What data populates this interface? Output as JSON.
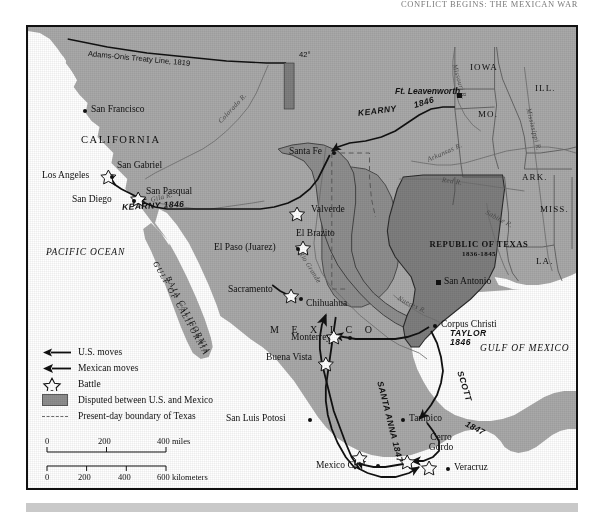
{
  "page": {
    "running_head": "Conflict Begins: The Mexican War"
  },
  "map": {
    "title": "Mexican War 1846-1848 campaign map",
    "colors": {
      "land": "#a9a9a9",
      "disputed": "#8e8e8e",
      "texas_republic": "#7e7e7e",
      "water": "#ffffff",
      "ink": "#111111",
      "border": "#4a4a4a",
      "river": "#6e6e6e",
      "bottom_bar": "#c9c9c9"
    },
    "treaty_line": {
      "label": "Adams-Onis Treaty Line, 1819",
      "latitude_marker": "42°"
    },
    "oceans": [
      {
        "name": "PACIFIC OCEAN"
      },
      {
        "name": "GULF OF MEXICO"
      },
      {
        "name": "GULF OF CALIFORNIA"
      }
    ],
    "regions": [
      {
        "name": "CALIFORNIA"
      },
      {
        "name": "BAJA CALIFORNIA"
      },
      {
        "name": "M E X I C O"
      },
      {
        "name": "REPUBLIC OF TEXAS"
      }
    ],
    "texas_republic": {
      "name": "REPUBLIC OF TEXAS",
      "dates": "1836-1845"
    },
    "states": [
      {
        "abbr": "IOWA"
      },
      {
        "abbr": "ILL."
      },
      {
        "abbr": "MO."
      },
      {
        "abbr": "ARK."
      },
      {
        "abbr": "MISS."
      },
      {
        "abbr": "LA."
      }
    ],
    "rivers": [
      {
        "name": "Colorado R."
      },
      {
        "name": "Gila R."
      },
      {
        "name": "Rio Grande"
      },
      {
        "name": "Arkansas R."
      },
      {
        "name": "Red R."
      },
      {
        "name": "Nueces R."
      },
      {
        "name": "Missouri R."
      },
      {
        "name": "Mississippi R."
      },
      {
        "name": "Sabine R."
      }
    ],
    "cities": [
      {
        "name": "San Francisco",
        "marker": "dot"
      },
      {
        "name": "Los Angeles",
        "marker": "dot"
      },
      {
        "name": "San Diego",
        "marker": "dot"
      },
      {
        "name": "Santa Fe",
        "marker": "dot"
      },
      {
        "name": "El Paso (Juarez)",
        "marker": "dot"
      },
      {
        "name": "Chihuahua",
        "marker": "dot"
      },
      {
        "name": "San Antonio",
        "marker": "sq"
      },
      {
        "name": "Corpus Christi",
        "marker": "dot"
      },
      {
        "name": "Monterrey",
        "marker": "dot"
      },
      {
        "name": "San Luis Potosi",
        "marker": "dot"
      },
      {
        "name": "Tampico",
        "marker": "dot"
      },
      {
        "name": "Mexico City",
        "marker": "dot"
      },
      {
        "name": "Veracruz",
        "marker": "dot"
      },
      {
        "name": "Ft. Leavenworth",
        "marker": "sq"
      }
    ],
    "battles": [
      {
        "name": "San Gabriel"
      },
      {
        "name": "San Pasqual"
      },
      {
        "name": "Valverde"
      },
      {
        "name": "El Brazito"
      },
      {
        "name": "Sacramento"
      },
      {
        "name": "Buena Vista"
      },
      {
        "name": "Cerro Gordo"
      }
    ],
    "routes": [
      {
        "commander": "KEARNY",
        "year": "1846",
        "side": "us"
      },
      {
        "commander": "KEARNY",
        "year": "1846",
        "side": "us"
      },
      {
        "commander": "TAYLOR",
        "year": "1846",
        "side": "us"
      },
      {
        "commander": "SCOTT",
        "year": "1847",
        "side": "us"
      },
      {
        "commander": "SANTA ANNA",
        "year": "1847",
        "side": "mexican"
      }
    ],
    "route_labels": {
      "kearny_east": "KEARNY",
      "kearny_east_year": "1846",
      "kearny_west": "KEARNY 1846",
      "taylor": "TAYLOR",
      "taylor_year": "1846",
      "scott": "SCOTT",
      "scott_year": "1847",
      "santa_anna": "SANTA ANNA 1847"
    }
  },
  "legend": {
    "items": [
      {
        "key": "us-arrow",
        "label": "U.S. moves"
      },
      {
        "key": "mexican-arrow",
        "label": "Mexican moves"
      },
      {
        "key": "battle-star",
        "label": "Battle"
      },
      {
        "key": "disputed-swatch",
        "label": "Disputed between U.S. and Mexico"
      },
      {
        "key": "dashed-line",
        "label": "Present-day boundary of Texas"
      }
    ]
  },
  "scale": {
    "miles": {
      "unit": "miles",
      "ticks": [
        "0",
        "200",
        "400"
      ]
    },
    "kilometers": {
      "unit": "kilometers",
      "ticks": [
        "0",
        "200",
        "400",
        "600"
      ]
    },
    "miles_label": "400 miles",
    "km_label": "600 kilometers"
  }
}
